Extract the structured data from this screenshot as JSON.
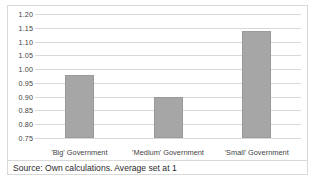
{
  "figure": {
    "source_note": "Source: Own calculations. Average set at 1",
    "bar_color": "#A6A6A6",
    "bar_edge_color": "#9A9A9A",
    "gridline_color": "#D9D9D9",
    "border_color": "#D9D9D9",
    "text_color": "#3F3F3F"
  },
  "chart_data": {
    "type": "bar",
    "title": "",
    "subtitle": "",
    "xlabel": "",
    "ylabel": "",
    "categories": [
      "'Big' Government",
      "'Medium' Government",
      "'Small' Government"
    ],
    "values": [
      0.98,
      0.9,
      1.14
    ],
    "ylim": [
      0.75,
      1.2
    ],
    "ytick_step": 0.05,
    "ytick_labels": [
      "1.20",
      "1.15",
      "1.10",
      "1.05",
      "1.00",
      "0.95",
      "0.90",
      "0.85",
      "0.80",
      "0.75"
    ],
    "ytick_values": [
      1.2,
      1.15,
      1.1,
      1.05,
      1.0,
      0.95,
      0.9,
      0.85,
      0.8,
      0.75
    ],
    "grid": true,
    "grid_axis": "y",
    "legend": false,
    "legend_position": "none",
    "annotations": [
      "Source: Own calculations. Average set at 1"
    ]
  }
}
